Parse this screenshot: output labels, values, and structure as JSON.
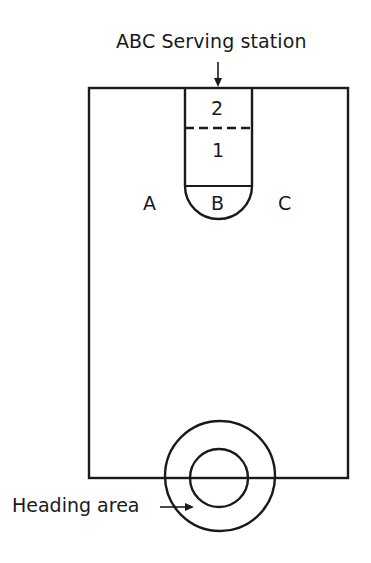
{
  "diagram": {
    "title": "ABC Serving station",
    "zones": {
      "zone_2": "2",
      "zone_1": "1",
      "zone_a": "A",
      "zone_b": "B",
      "zone_c": "C"
    },
    "heading_label": "Heading area",
    "colors": {
      "line": "#1a1a1a",
      "background": "#ffffff"
    }
  }
}
